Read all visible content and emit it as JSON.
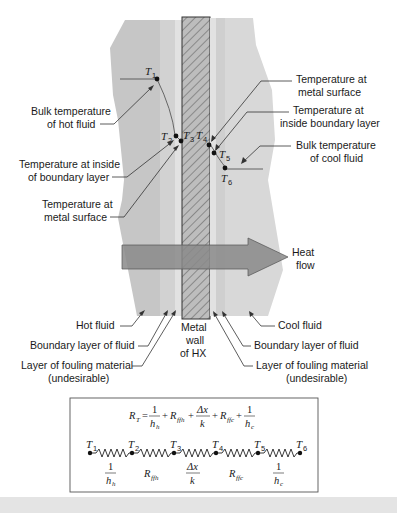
{
  "figure": {
    "type": "heat exchanger wall temperature profile and thermal resistance network",
    "colors": {
      "hot_fluid": "#c9c9c9",
      "cool_fluid": "#d6d6d6",
      "boundary_layer": "#dcdcdc",
      "fouling_layer": "#b5b5b5",
      "wall_fill": "#bdbdbd",
      "arrow": "#8c8c8c",
      "text": "#1a1a1a",
      "background": "#ffffff"
    },
    "temperatures": {
      "T1": {
        "sym": "T",
        "sub": "1"
      },
      "T2": {
        "sym": "T",
        "sub": "2"
      },
      "T3": {
        "sym": "T",
        "sub": "3"
      },
      "T4": {
        "sym": "T",
        "sub": "4"
      },
      "T5": {
        "sym": "T",
        "sub": "5"
      },
      "T6": {
        "sym": "T",
        "sub": "6"
      }
    },
    "left_labels": {
      "bulk_hot": [
        "Bulk temperature",
        "of hot fluid"
      ],
      "inside_bl_hot": [
        "Temperature at inside",
        "of boundary layer"
      ],
      "metal_surface_hot": [
        "Temperature at",
        "metal surface"
      ]
    },
    "right_labels": {
      "metal_surface_cool": [
        "Temperature at",
        "metal surface"
      ],
      "inside_bl_cool": [
        "Temperature at",
        "inside boundary layer"
      ],
      "bulk_cool": [
        "Bulk temperature",
        "of cool fluid"
      ]
    },
    "heat_flow": [
      "Heat",
      "flow"
    ],
    "bottom_labels": {
      "hot_fluid": "Hot fluid",
      "bl_left": "Boundary layer of fluid",
      "fouling_left": [
        "Layer of fouling material",
        "(undesirable)"
      ],
      "wall": [
        "Metal",
        "wall",
        "of HX"
      ],
      "cool_fluid": "Cool fluid",
      "bl_right": "Boundary layer of fluid",
      "fouling_right": [
        "Layer of fouling material",
        "(undesirable)"
      ]
    },
    "equation": {
      "lhs": "R",
      "lhs_sub": "T",
      "equals": "=",
      "term1_num": "1",
      "term1_den": "h",
      "term1_den_sub": "h",
      "plus": "+",
      "term2": "R",
      "term2_sub": "ffh",
      "term3_num": "Δx",
      "term3_den": "k",
      "term4": "R",
      "term4_sub": "ffc",
      "term5_num": "1",
      "term5_den": "h",
      "term5_den_sub": "c"
    },
    "network": {
      "nodes": [
        "1",
        "2",
        "3",
        "4",
        "5",
        "6"
      ],
      "resistors": [
        {
          "type": "frac",
          "num": "1",
          "den": "h",
          "den_sub": "h"
        },
        {
          "type": "R",
          "sym": "R",
          "sub": "ffh"
        },
        {
          "type": "frac",
          "num": "Δx",
          "den": "k",
          "den_sub": ""
        },
        {
          "type": "R",
          "sym": "R",
          "sub": "ffc"
        },
        {
          "type": "frac",
          "num": "1",
          "den": "h",
          "den_sub": "c"
        }
      ]
    }
  }
}
